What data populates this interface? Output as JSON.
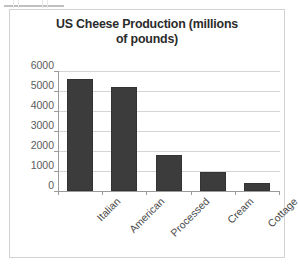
{
  "chart_data": {
    "type": "bar",
    "title": "US Cheese Production (millions of pounds)",
    "title_lines": [
      "US Cheese Production (millions",
      "of pounds)"
    ],
    "categories": [
      "Italian",
      "American",
      "Processed",
      "Cream",
      "Cottage"
    ],
    "values": [
      5600,
      5200,
      1800,
      950,
      400
    ],
    "xlabel": "",
    "ylabel": "",
    "ylim": [
      0,
      6000
    ],
    "ytick_labels": [
      "6000",
      "5000",
      "4000",
      "3000",
      "2000",
      "1000",
      "0"
    ],
    "ytick_values": [
      6000,
      5000,
      4000,
      3000,
      2000,
      1000,
      0
    ],
    "grid": true,
    "legend": "none",
    "series_color": "#3c3c3c",
    "gridline_color": "#d4d4d4",
    "axis_color": "#9a9a9a",
    "tick_label_color": "#5b5b5b",
    "title_color": "#2b2b2b",
    "frame_color": "#d2d2d2",
    "background": "#ffffff",
    "x_tick_label_rotation": -45
  }
}
